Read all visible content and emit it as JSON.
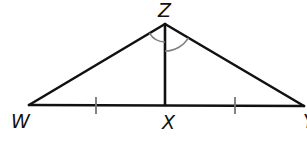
{
  "diagram": {
    "type": "geometry-triangle",
    "vertices": {
      "Z": {
        "label": "Z",
        "x": 165,
        "y": 24
      },
      "W": {
        "label": "W",
        "x": 29,
        "y": 105
      },
      "X": {
        "label": "X",
        "x": 165,
        "y": 105
      },
      "Y": {
        "label": "Y",
        "x": 303,
        "y": 106
      }
    },
    "labels": {
      "z": "Z",
      "w": "W",
      "x": "X",
      "y": "Y"
    },
    "segments": [
      {
        "name": "WZ",
        "from": "W",
        "to": "Z"
      },
      {
        "name": "ZY",
        "from": "Z",
        "to": "Y"
      },
      {
        "name": "WY",
        "from": "W",
        "to": "Y"
      },
      {
        "name": "ZX",
        "from": "Z",
        "to": "X"
      }
    ],
    "congruence_marks": {
      "segment_ticks": [
        "WX",
        "XY"
      ],
      "angle_arcs": [
        "WZX",
        "XZY"
      ]
    },
    "colors": {
      "line": "#111111",
      "mark": "#808080",
      "background": "#ffffff"
    }
  }
}
